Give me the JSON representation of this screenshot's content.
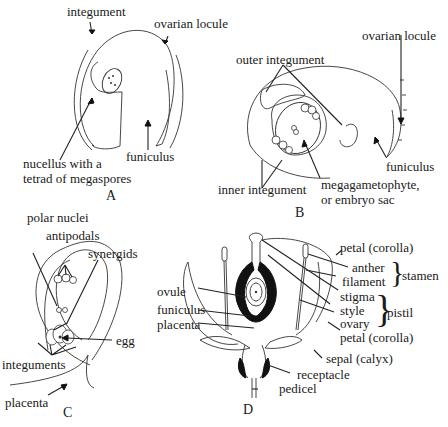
{
  "figure": {
    "panels": [
      {
        "id": "A",
        "letter": "A",
        "labels": {
          "integument": "integument",
          "ovarian_locule": "ovarian locule",
          "nucellus_line1": "nucellus with a",
          "nucellus_line2": "tetrad of megaspores",
          "funiculus": "funiculus"
        }
      },
      {
        "id": "B",
        "letter": "B",
        "labels": {
          "outer_integument": "outer integument",
          "ovarian_locule": "ovarian locule",
          "funiculus": "funiculus",
          "inner_integument": "inner integument",
          "megagametophyte_line1": "megagametophyte,",
          "megagametophyte_line2": "or embryo sac"
        }
      },
      {
        "id": "C",
        "letter": "C",
        "labels": {
          "polar_nuclei": "polar nuclei",
          "antipodals": "antipodals",
          "synergids": "synergids",
          "egg": "egg",
          "integuments": "integuments",
          "placenta": "placenta"
        }
      },
      {
        "id": "D",
        "letter": "D",
        "labels": {
          "petal_top": "petal (corolla)",
          "anther": "anther",
          "filament": "filament",
          "stamen": "stamen",
          "stigma": "stigma",
          "style": "style",
          "ovary": "ovary",
          "pistil": "pistil",
          "petal_bottom": "petal (corolla)",
          "sepal": "sepal (calyx)",
          "receptacle": "receptacle",
          "pedicel": "pedicel",
          "ovule": "ovule",
          "funiculus": "funiculus",
          "placenta": "placenta"
        }
      }
    ]
  }
}
